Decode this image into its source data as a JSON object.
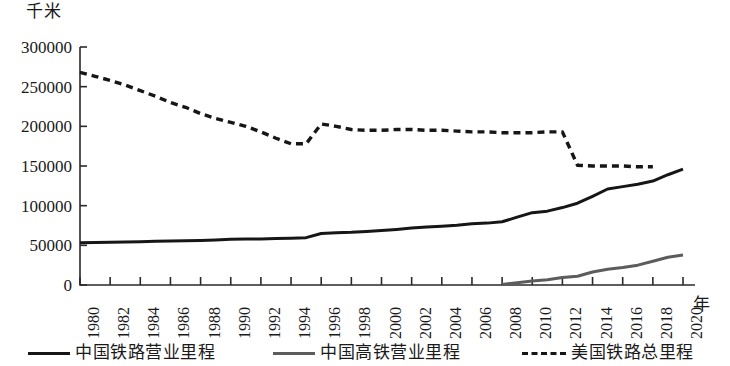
{
  "axes": {
    "y_unit": "千米",
    "x_unit": "年",
    "y_ticks": [
      "0",
      "50000",
      "100000",
      "150000",
      "200000",
      "250000",
      "300000"
    ],
    "x_ticks": [
      "1980",
      "1982",
      "1984",
      "1986",
      "1988",
      "1990",
      "1992",
      "1994",
      "1996",
      "1998",
      "2000",
      "2002",
      "2004",
      "2006",
      "2008",
      "2010",
      "2012",
      "2014",
      "2016",
      "2018",
      "2020"
    ]
  },
  "legend": {
    "items": [
      {
        "label": "中国铁路营业里程",
        "style": "solid-dark",
        "color": "#161616"
      },
      {
        "label": "中国高铁营业里程",
        "style": "solid-gray",
        "color": "#5c5c5c"
      },
      {
        "label": "美国铁路总里程",
        "style": "dashed-dark",
        "color": "#161616"
      }
    ]
  },
  "chart_data": {
    "type": "line",
    "title": "",
    "xlabel": "年",
    "ylabel": "千米",
    "xlim": [
      1980,
      2020
    ],
    "ylim": [
      0,
      300000
    ],
    "grid": false,
    "legend_position": "bottom",
    "x": [
      1980,
      1981,
      1982,
      1983,
      1984,
      1985,
      1986,
      1987,
      1988,
      1989,
      1990,
      1991,
      1992,
      1993,
      1994,
      1995,
      1996,
      1997,
      1998,
      1999,
      2000,
      2001,
      2002,
      2003,
      2004,
      2005,
      2006,
      2007,
      2008,
      2009,
      2010,
      2011,
      2012,
      2013,
      2014,
      2015,
      2016,
      2017,
      2018,
      2019,
      2020
    ],
    "series": [
      {
        "name": "中国铁路营业里程",
        "style": "solid",
        "color": "#161616",
        "values": [
          53300,
          53600,
          53900,
          54200,
          54600,
          55000,
          55500,
          55800,
          56100,
          56800,
          57800,
          57900,
          58100,
          58600,
          59000,
          59700,
          64900,
          65900,
          66400,
          67400,
          68700,
          70100,
          71900,
          73000,
          74200,
          75400,
          77100,
          78000,
          79700,
          85500,
          91200,
          93100,
          97600,
          103100,
          111800,
          121000,
          124000,
          127000,
          131000,
          139000,
          146000
        ]
      },
      {
        "name": "中国高铁营业里程",
        "style": "solid",
        "color": "#5c5c5c",
        "values": [
          null,
          null,
          null,
          null,
          null,
          null,
          null,
          null,
          null,
          null,
          null,
          null,
          null,
          null,
          null,
          null,
          null,
          null,
          null,
          null,
          null,
          null,
          null,
          null,
          null,
          null,
          null,
          null,
          672,
          2699,
          5133,
          6601,
          9356,
          11028,
          16456,
          19838,
          22000,
          25000,
          29900,
          35000,
          37900
        ]
      },
      {
        "name": "美国铁路总里程",
        "style": "dashed",
        "color": "#161616",
        "values": [
          268000,
          263000,
          258000,
          252000,
          245000,
          238000,
          230000,
          224000,
          216000,
          210000,
          205000,
          200000,
          193000,
          185000,
          178000,
          178000,
          203000,
          200000,
          196000,
          195000,
          195000,
          196000,
          196000,
          195000,
          195000,
          194000,
          193000,
          193000,
          192000,
          192000,
          192000,
          193000,
          193000,
          151000,
          150000,
          150000,
          150000,
          149000,
          149000,
          null,
          null
        ]
      }
    ]
  }
}
